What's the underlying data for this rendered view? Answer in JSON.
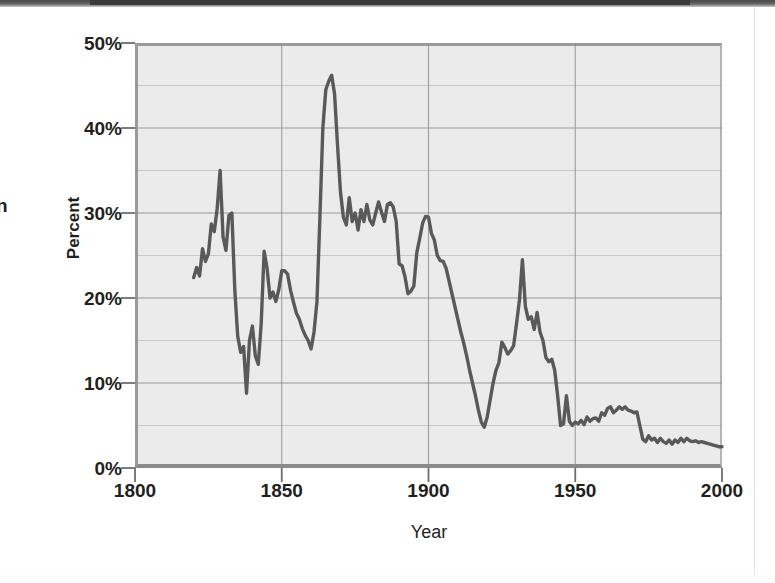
{
  "page": {
    "cropped_left_text": "n",
    "background_color": "#ffffff"
  },
  "chart": {
    "y_axis_title": "Percent",
    "x_axis_title": "Year",
    "plot_background_color": "#ebebeb",
    "line_color": "#595959",
    "gridline_color": "#8c8c8c",
    "axis_color": "#9a9a9a",
    "y_ticks": [
      "0%",
      "10%",
      "20%",
      "30%",
      "40%",
      "50%"
    ],
    "x_ticks": [
      "1800",
      "1850",
      "1900",
      "1950",
      "2000"
    ]
  },
  "chart_data": {
    "type": "line",
    "title": "",
    "xlabel": "Year",
    "ylabel": "Percent",
    "xlim": [
      1800,
      2000
    ],
    "ylim": [
      0,
      50
    ],
    "y_tick_values": [
      0,
      10,
      20,
      30,
      40,
      50
    ],
    "y_tick_labels": [
      "0%",
      "10%",
      "20%",
      "30%",
      "40%",
      "50%"
    ],
    "x_tick_values": [
      1800,
      1850,
      1900,
      1950,
      2000
    ],
    "x_tick_labels": [
      "1800",
      "1850",
      "1900",
      "1950",
      "2000"
    ],
    "grid": true,
    "grid_minor_y_step": 5,
    "legend": "none",
    "series": [
      {
        "name": "Percent",
        "x": [
          1820,
          1821,
          1822,
          1823,
          1824,
          1825,
          1826,
          1827,
          1828,
          1829,
          1830,
          1831,
          1832,
          1833,
          1834,
          1835,
          1836,
          1837,
          1838,
          1839,
          1840,
          1841,
          1842,
          1843,
          1844,
          1845,
          1846,
          1847,
          1848,
          1849,
          1850,
          1851,
          1852,
          1853,
          1854,
          1855,
          1856,
          1857,
          1858,
          1859,
          1860,
          1861,
          1862,
          1863,
          1864,
          1865,
          1866,
          1867,
          1868,
          1869,
          1870,
          1871,
          1872,
          1873,
          1874,
          1875,
          1876,
          1877,
          1878,
          1879,
          1880,
          1881,
          1882,
          1883,
          1884,
          1885,
          1886,
          1887,
          1888,
          1889,
          1890,
          1891,
          1892,
          1893,
          1894,
          1895,
          1896,
          1897,
          1898,
          1899,
          1900,
          1901,
          1902,
          1903,
          1904,
          1905,
          1906,
          1907,
          1908,
          1909,
          1910,
          1911,
          1912,
          1913,
          1914,
          1915,
          1916,
          1917,
          1918,
          1919,
          1920,
          1921,
          1922,
          1923,
          1924,
          1925,
          1926,
          1927,
          1928,
          1929,
          1930,
          1931,
          1932,
          1933,
          1934,
          1935,
          1936,
          1937,
          1938,
          1939,
          1940,
          1941,
          1942,
          1943,
          1944,
          1945,
          1946,
          1947,
          1948,
          1949,
          1950,
          1951,
          1952,
          1953,
          1954,
          1955,
          1956,
          1957,
          1958,
          1959,
          1960,
          1961,
          1962,
          1963,
          1964,
          1965,
          1966,
          1967,
          1968,
          1969,
          1970,
          1971,
          1972,
          1973,
          1974,
          1975,
          1976,
          1977,
          1978,
          1979,
          1980,
          1981,
          1982,
          1983,
          1984,
          1985,
          1986,
          1987,
          1988,
          1989,
          1990,
          1991,
          1992,
          1993,
          1994,
          1995,
          1996,
          1997,
          1998,
          1999,
          2000
        ],
        "y": [
          22.4,
          23.6,
          22.6,
          25.8,
          24.3,
          25.2,
          28.7,
          27.8,
          30.5,
          35.0,
          27.2,
          25.6,
          29.7,
          30.0,
          21.0,
          15.5,
          13.6,
          14.3,
          8.8,
          15.0,
          16.7,
          13.2,
          12.2,
          17.0,
          25.5,
          23.5,
          20.0,
          20.7,
          19.6,
          21.0,
          23.2,
          23.2,
          22.8,
          20.9,
          19.5,
          18.2,
          17.5,
          16.4,
          15.6,
          15.0,
          14.0,
          16.0,
          19.6,
          29.5,
          40.0,
          44.5,
          45.5,
          46.2,
          44.0,
          38.0,
          32.5,
          29.5,
          28.6,
          31.8,
          29.0,
          30.0,
          28.0,
          30.4,
          29.0,
          31.0,
          29.2,
          28.6,
          30.0,
          31.3,
          30.1,
          29.0,
          31.0,
          31.2,
          30.7,
          29.0,
          24.0,
          23.8,
          22.5,
          20.5,
          20.8,
          21.4,
          25.3,
          27.0,
          28.8,
          29.6,
          29.5,
          27.6,
          26.8,
          25.0,
          24.4,
          24.3,
          23.5,
          22.0,
          20.5,
          19.0,
          17.5,
          16.0,
          14.7,
          13.2,
          11.5,
          10.0,
          8.5,
          6.8,
          5.4,
          4.8,
          6.0,
          8.0,
          10.0,
          11.5,
          12.4,
          14.8,
          14.2,
          13.4,
          13.8,
          14.4,
          17.0,
          19.8,
          24.5,
          19.0,
          17.5,
          17.8,
          16.3,
          18.3,
          16.0,
          15.0,
          13.0,
          12.5,
          12.8,
          11.5,
          8.5,
          5.0,
          5.2,
          8.5,
          5.5,
          5.0,
          5.4,
          5.2,
          5.6,
          5.1,
          6.0,
          5.5,
          5.8,
          5.9,
          5.5,
          6.5,
          6.2,
          7.0,
          7.2,
          6.5,
          6.8,
          7.2,
          6.9,
          7.2,
          6.8,
          6.7,
          6.5,
          6.6,
          5.0,
          3.4,
          3.1,
          3.8,
          3.3,
          3.5,
          3.0,
          3.5,
          3.1,
          2.9,
          3.3,
          2.8,
          3.3,
          3.0,
          3.5,
          3.1,
          3.5,
          3.2,
          3.1,
          3.2,
          3.0,
          3.1,
          3.0,
          2.9,
          2.8,
          2.7,
          2.6,
          2.5,
          2.5
        ]
      }
    ]
  }
}
